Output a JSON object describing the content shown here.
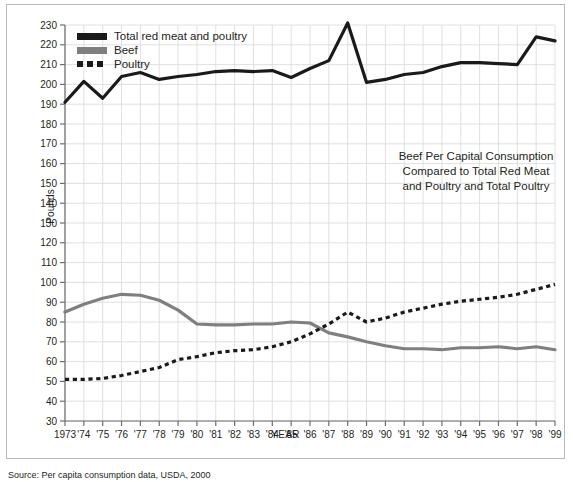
{
  "figure": {
    "ylabel": "Pounds",
    "xlabel": "YEAR",
    "annotation_line1": "Beef Per Capital Consumption",
    "annotation_line2": "Compared to Total Red Meat",
    "annotation_line3": "and Poultry and Total Poultry",
    "caption": "Source: Per capita consumption data, USDA, 2000",
    "colors": {
      "total": "#1a1a1a",
      "beef": "#7f7f7f",
      "poultry": "#1a1a1a",
      "grid": "#d8d8d8",
      "axis": "#6d6d6d",
      "border": "#b9b9b9"
    }
  },
  "legend": {
    "position": "top-left",
    "items": [
      {
        "label": "Total red meat and poultry",
        "style": "solid-black",
        "icon": "line-swatch-icon"
      },
      {
        "label": "Beef",
        "style": "solid-gray",
        "icon": "line-swatch-icon"
      },
      {
        "label": "Poultry",
        "style": "dotted-black",
        "icon": "dotted-swatch-icon"
      }
    ]
  },
  "chart_data": {
    "type": "line",
    "title": "Beef Per Capital Consumption Compared to Total Red Meat and Poultry and Total Poultry",
    "xlabel": "YEAR",
    "ylabel": "Pounds",
    "xlim": [
      1973,
      1999
    ],
    "ylim": [
      30,
      230
    ],
    "ytick_step": 10,
    "grid": true,
    "yticks": [
      30,
      40,
      50,
      60,
      70,
      80,
      90,
      100,
      110,
      120,
      130,
      140,
      150,
      160,
      170,
      180,
      190,
      200,
      210,
      220,
      230
    ],
    "x": [
      1973,
      1974,
      1975,
      1976,
      1977,
      1978,
      1979,
      1980,
      1981,
      1982,
      1983,
      1984,
      1985,
      1986,
      1987,
      1988,
      1989,
      1990,
      1991,
      1992,
      1993,
      1994,
      1995,
      1996,
      1997,
      1998,
      1999
    ],
    "xticklabels": [
      "1973",
      "'74",
      "'75",
      "'76",
      "'77",
      "'78",
      "'79",
      "'80",
      "'81",
      "'82",
      "'83",
      "'84",
      "'85",
      "'86",
      "'87",
      "'88",
      "'89",
      "'90",
      "'91",
      "'92",
      "'93",
      "'94",
      "'95",
      "'96",
      "'97",
      "'98",
      "'99"
    ],
    "series": [
      {
        "name": "Total red meat and poultry",
        "color": "#1a1a1a",
        "style": "solid",
        "values": [
          191,
          201.5,
          193,
          204,
          206,
          202.5,
          204,
          205,
          206.5,
          207,
          206.5,
          207,
          203.5,
          208,
          212,
          231,
          201,
          202.5,
          205,
          206,
          209,
          211,
          211,
          210.5,
          210,
          224,
          222
        ]
      },
      {
        "name": "Beef",
        "color": "#7f7f7f",
        "style": "solid",
        "values": [
          85,
          89,
          92,
          94,
          93.5,
          91,
          86,
          79,
          78.5,
          78.5,
          79,
          79,
          80,
          79.5,
          74.5,
          72.5,
          70,
          68,
          66.5,
          66.5,
          66,
          67,
          67,
          67.5,
          66.5,
          67.5,
          66
        ]
      },
      {
        "name": "Poultry",
        "color": "#1a1a1a",
        "style": "dotted",
        "values": [
          51,
          51,
          51.5,
          53,
          55,
          57,
          61,
          62.5,
          64.5,
          65.5,
          66,
          67.5,
          70,
          74,
          79,
          85,
          80,
          82,
          85,
          87,
          89,
          90.5,
          91.5,
          92.5,
          94,
          96.5,
          99
        ]
      }
    ]
  }
}
